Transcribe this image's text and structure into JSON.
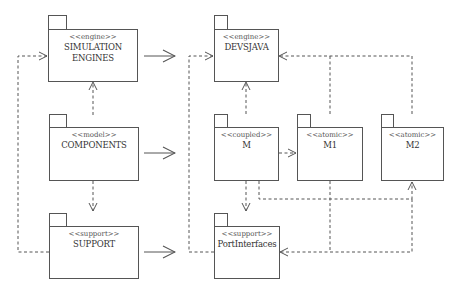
{
  "diagram": {
    "type": "UML package diagram",
    "colors": {
      "line": "#555555",
      "text": "#333333",
      "background": "#ffffff"
    },
    "packages": [
      {
        "id": "sim",
        "stereotype": "<<engine>>",
        "name": "SIMULATION ENGINES"
      },
      {
        "id": "comp",
        "stereotype": "<<model>>",
        "name": "COMPONENTS"
      },
      {
        "id": "sup",
        "stereotype": "<<support>>",
        "name": "SUPPORT"
      },
      {
        "id": "devs",
        "stereotype": "<<engine>>",
        "name": "DEVSJAVA"
      },
      {
        "id": "m",
        "stereotype": "<<coupled>>",
        "name": "M"
      },
      {
        "id": "m1",
        "stereotype": "<<atomic>>",
        "name": "M1"
      },
      {
        "id": "m2",
        "stereotype": "<<atomic>>",
        "name": "M2"
      },
      {
        "id": "port",
        "stereotype": "<<support>>",
        "name": "PortInterfaces"
      }
    ],
    "relations": [
      {
        "from": "SIMULATION ENGINES",
        "to": "DEVSJAVA",
        "style": "solid-open-arrow",
        "meaning": "realized by"
      },
      {
        "from": "COMPONENTS",
        "to": "M / M1 / M2",
        "style": "solid-open-arrow",
        "meaning": "realized by"
      },
      {
        "from": "SUPPORT",
        "to": "PortInterfaces",
        "style": "solid-open-arrow",
        "meaning": "realized by"
      },
      {
        "from": "COMPONENTS",
        "to": "SIMULATION ENGINES",
        "style": "dashed-dependency"
      },
      {
        "from": "COMPONENTS",
        "to": "SUPPORT",
        "style": "dashed-dependency"
      },
      {
        "from": "SUPPORT",
        "to": "SIMULATION ENGINES",
        "style": "dashed-dependency"
      },
      {
        "from": "M",
        "to": "DEVSJAVA",
        "style": "dashed-dependency"
      },
      {
        "from": "M1",
        "to": "DEVSJAVA",
        "style": "dashed-dependency"
      },
      {
        "from": "M2",
        "to": "DEVSJAVA",
        "style": "dashed-dependency"
      },
      {
        "from": "M",
        "to": "M1",
        "style": "dashed-dependency"
      },
      {
        "from": "M",
        "to": "M2",
        "style": "dashed-dependency"
      },
      {
        "from": "M",
        "to": "PortInterfaces",
        "style": "dashed-dependency"
      },
      {
        "from": "M1",
        "to": "PortInterfaces",
        "style": "dashed-dependency"
      },
      {
        "from": "M2",
        "to": "PortInterfaces",
        "style": "dashed-dependency"
      },
      {
        "from": "PortInterfaces",
        "to": "DEVSJAVA",
        "style": "dashed-dependency"
      }
    ]
  }
}
